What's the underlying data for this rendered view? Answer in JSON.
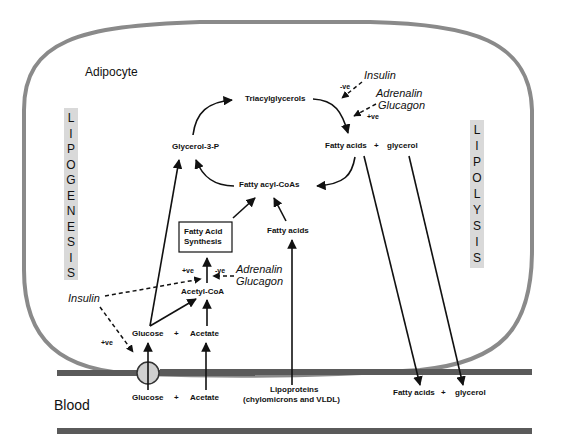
{
  "cell_label": "Adipocyte",
  "blood_label": "Blood",
  "sidebars": {
    "left": {
      "title": "LIPOGENESIS",
      "letters": [
        "L",
        "I",
        "P",
        "O",
        "G",
        "E",
        "N",
        "E",
        "S",
        "I",
        "S"
      ]
    },
    "right": {
      "title": "LIPOLYSIS",
      "letters": [
        "L",
        "I",
        "P",
        "O",
        "L",
        "Y",
        "S",
        "I",
        "S"
      ]
    }
  },
  "nodes": {
    "triacylglycerols": "Triacylglycerols",
    "glycerol3p": "Glycerol-3-P",
    "fatty_acyl_coas": "Fatty acyl-CoAs",
    "fatty_acids_lipolysis": "Fatty acids",
    "plus1": "+",
    "glycerol_lipolysis": "glycerol",
    "fatty_acid_synthesis_line1": "Fatty Acid",
    "fatty_acid_synthesis_line2": "Synthesis",
    "fatty_acids_uptake": "Fatty acids",
    "acetyl_coa": "Acetyl-CoA",
    "glucose_cell": "Glucose",
    "plus2": "+",
    "acetate_cell": "Acetate",
    "glucose_blood": "Glucose",
    "plus3": "+",
    "acetate_blood": "Acetate",
    "lipoproteins_line1": "Lipoproteins",
    "lipoproteins_line2": "(chylomicrons and VLDL)",
    "fatty_acids_blood": "Fatty acids",
    "plus4": "+",
    "glycerol_blood": "glycerol"
  },
  "regulators": {
    "insulin_lipolysis": {
      "name": "Insulin",
      "effect": "-ve"
    },
    "adrenalin_glucagon_lipolysis": {
      "name1": "Adrenalin",
      "name2": "Glucagon",
      "effect": "+ve"
    },
    "insulin_lipogenesis": {
      "name": "Insulin",
      "effect_synthesis": "+ve",
      "effect_transport": "+ve"
    },
    "adrenalin_glucagon_lipogenesis": {
      "name1": "Adrenalin",
      "name2": "Glucagon",
      "effect": "-ve"
    }
  },
  "colors": {
    "membrane": "#8a8a8a",
    "vessel": "#5a5a5a",
    "sidebar_bg": "#d9d9d9",
    "transporter": "#cfcfcf",
    "arrow": "#111111"
  }
}
